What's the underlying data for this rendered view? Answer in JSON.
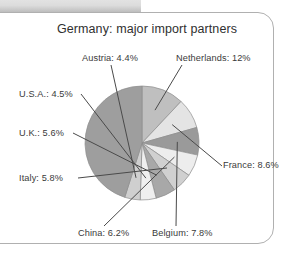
{
  "figure": {
    "title": "Germany: major import partners",
    "border_color": "#b0b0b0",
    "topbar_color": "#d8d8d8",
    "background": "#ffffff"
  },
  "chart_data": {
    "type": "pie",
    "title": "Germany: major import partners",
    "xlabel": "",
    "ylabel": "",
    "legend_position": "none",
    "grid": false,
    "center": [
      142,
      143
    ],
    "radius": 57,
    "start_angle_deg": 0,
    "direction": "clockwise",
    "categories": [
      "Netherlands",
      "France",
      "Belgium",
      "China",
      "Italy",
      "U.K.",
      "U.S.A.",
      "Austria",
      "Other"
    ],
    "values": [
      12,
      8.6,
      7.8,
      6.2,
      5.8,
      5.6,
      4.5,
      4.4,
      45.1
    ],
    "colors": [
      "#bfbfbf",
      "#e4e4e4",
      "#9a9a9a",
      "#ededed",
      "#d0d0d0",
      "#a8a8a8",
      "#efefef",
      "#cfcfcf",
      "#9e9e9e"
    ],
    "slices": [
      {
        "label": "Netherlands: 12%",
        "name": "Netherlands",
        "value": 12,
        "display": "12%",
        "color": "#bfbfbf",
        "labeled": true
      },
      {
        "label": "France: 8.6%",
        "name": "France",
        "value": 8.6,
        "display": "8.6%",
        "color": "#e4e4e4",
        "labeled": true
      },
      {
        "label": "Belgium: 7.8%",
        "name": "Belgium",
        "value": 7.8,
        "display": "7.8%",
        "color": "#9a9a9a",
        "labeled": true
      },
      {
        "label": "China: 6.2%",
        "name": "China",
        "value": 6.2,
        "display": "6.2%",
        "color": "#ededed",
        "labeled": true
      },
      {
        "label": "Italy: 5.8%",
        "name": "Italy",
        "value": 5.8,
        "display": "5.8%",
        "color": "#d0d0d0",
        "labeled": true
      },
      {
        "label": "U.K.: 5.6%",
        "name": "U.K.",
        "value": 5.6,
        "display": "5.6%",
        "color": "#a8a8a8",
        "labeled": true
      },
      {
        "label": "U.S.A.: 4.5%",
        "name": "U.S.A.",
        "value": 4.5,
        "display": "4.5%",
        "color": "#efefef",
        "labeled": true
      },
      {
        "label": "Austria: 4.4%",
        "name": "Austria",
        "value": 4.4,
        "display": "4.4%",
        "color": "#cfcfcf",
        "labeled": true
      },
      {
        "label": "",
        "name": "Other",
        "value": 45.1,
        "display": "",
        "color": "#9e9e9e",
        "labeled": false
      }
    ],
    "labels": [
      "Netherlands: 12%",
      "France: 8.6%",
      "Belgium: 7.8%",
      "China: 6.2%",
      "Italy: 5.8%",
      "U.K.: 5.6%",
      "U.S.A.: 4.5%",
      "Austria: 4.4%"
    ]
  }
}
